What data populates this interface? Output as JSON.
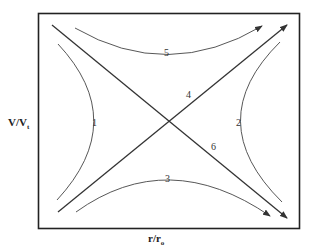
{
  "axes": {
    "y_label_main": "V/V",
    "y_label_sub": "t",
    "x_label_main": "r/r",
    "x_label_sub": "o"
  },
  "curves": [
    {
      "id": "1",
      "label": "1",
      "kind": "hyperbola-left"
    },
    {
      "id": "2",
      "label": "2",
      "kind": "hyperbola-right"
    },
    {
      "id": "3",
      "label": "3",
      "kind": "hyperbola-bottom",
      "arrow": true
    },
    {
      "id": "4",
      "label": "4",
      "kind": "asymptote-rising",
      "arrow": true
    },
    {
      "id": "5",
      "label": "5",
      "kind": "hyperbola-top",
      "arrow": true
    },
    {
      "id": "6",
      "label": "6",
      "kind": "asymptote-falling",
      "arrow": true
    }
  ],
  "colors": {
    "line": "#333333",
    "frame": "#222222"
  }
}
